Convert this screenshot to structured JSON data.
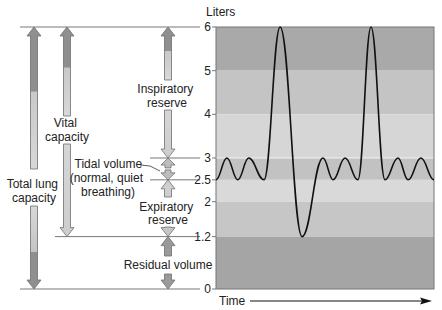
{
  "chart_data": {
    "type": "line",
    "title": "",
    "ylabel": "Liters",
    "xlabel": "Time",
    "ylim": [
      0,
      6
    ],
    "y_ticks": [
      {
        "value": 6,
        "label": "6"
      },
      {
        "value": 5,
        "label": "5"
      },
      {
        "value": 4,
        "label": "4"
      },
      {
        "value": 3,
        "label": "3"
      },
      {
        "value": 2.5,
        "label": "2.5"
      },
      {
        "value": 2,
        "label": "2"
      },
      {
        "value": 1.2,
        "label": "1.2"
      },
      {
        "value": 0,
        "label": "0"
      }
    ],
    "bands": [
      {
        "from": 5,
        "to": 6,
        "color": "#a9a9a9"
      },
      {
        "from": 4,
        "to": 5,
        "color": "#c4c4c4"
      },
      {
        "from": 3,
        "to": 4,
        "color": "#d6d6d6"
      },
      {
        "from": 2.5,
        "to": 3,
        "color": "#c2c2c2"
      },
      {
        "from": 2,
        "to": 2.5,
        "color": "#d9d9d9"
      },
      {
        "from": 1.2,
        "to": 2,
        "color": "#c6c6c6"
      },
      {
        "from": 0,
        "to": 1.2,
        "color": "#a5a5a5"
      }
    ],
    "series": [
      {
        "name": "Lung volume",
        "note": "Spirogram: quiet tidal breathing between 2.5 and 3 L, two maximal inspirations to 6 L, one maximal expiration to 1.2 L",
        "points": [
          [
            0.0,
            2.5
          ],
          [
            0.05,
            3.0
          ],
          [
            0.1,
            2.5
          ],
          [
            0.15,
            3.0
          ],
          [
            0.22,
            2.5
          ],
          [
            0.294,
            6.0
          ],
          [
            0.395,
            1.2
          ],
          [
            0.491,
            3.0
          ],
          [
            0.537,
            2.5
          ],
          [
            0.592,
            3.0
          ],
          [
            0.651,
            2.5
          ],
          [
            0.711,
            6.0
          ],
          [
            0.775,
            2.5
          ],
          [
            0.835,
            3.0
          ],
          [
            0.881,
            2.5
          ],
          [
            0.94,
            3.0
          ],
          [
            1.0,
            2.5
          ]
        ]
      }
    ],
    "volumes": [
      {
        "name": "Inspiratory reserve",
        "from": 3,
        "to": 6
      },
      {
        "name": "Tidal volume (normal, quiet breathing)",
        "from": 2.5,
        "to": 3
      },
      {
        "name": "Expiratory reserve",
        "from": 1.2,
        "to": 2.5
      },
      {
        "name": "Residual volume",
        "from": 0,
        "to": 1.2
      }
    ],
    "capacities": [
      {
        "name": "Vital capacity",
        "from": 1.2,
        "to": 6
      },
      {
        "name": "Total lung capacity",
        "from": 0,
        "to": 6
      }
    ]
  },
  "labels": {
    "y_axis_title": "Liters",
    "x_axis_title": "Time",
    "total_lung_capacity": [
      "Total lung",
      "capacity"
    ],
    "vital_capacity": [
      "Vital",
      "capacity"
    ],
    "inspiratory_reserve": [
      "Inspiratory",
      "reserve"
    ],
    "tidal_volume": [
      "Tidal volume",
      "(normal, quiet",
      "breathing)"
    ],
    "expiratory_reserve": [
      "Expiratory",
      "reserve"
    ],
    "residual_volume": "Residual volume"
  },
  "colors": {
    "line": "#111111",
    "guide": "#555555",
    "arrow_dark": "#8f8f8f",
    "arrow_mid": "#b5b5b5",
    "arrow_light": "#d3d3d3",
    "arrow_stroke": "#6e6e6e",
    "tidal_band_highlight": "#f2f2f2"
  }
}
